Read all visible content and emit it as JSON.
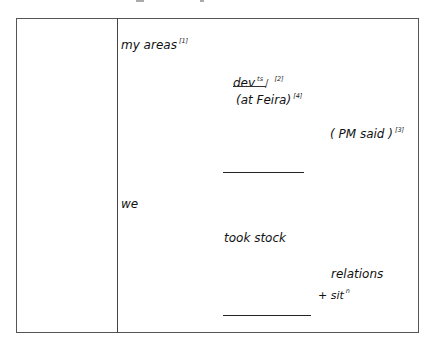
{
  "table": {
    "left_column": {
      "text": ""
    },
    "notes": {
      "my_areas": {
        "text": "my areas",
        "ref": "[1]"
      },
      "dev": {
        "text": "dev",
        "sup": "ts",
        "slash": "/",
        "ref": "[2]"
      },
      "at_feira": {
        "text": "(at Feira)",
        "ref": "[4]"
      },
      "pm_said": {
        "text": "( PM said )",
        "ref": "[3]"
      },
      "we": {
        "text": "we"
      },
      "took_stock": {
        "text": "took stock"
      },
      "relations": {
        "text": "relations"
      },
      "sit": {
        "text": "+ sit",
        "sup": "n"
      }
    }
  }
}
